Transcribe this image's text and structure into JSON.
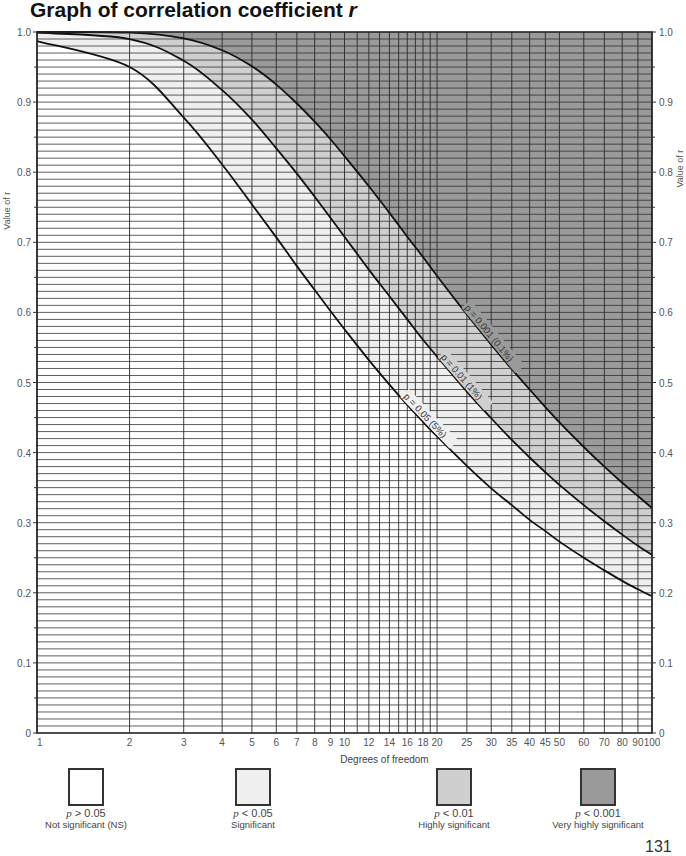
{
  "title": "Graph of correlation coefficient",
  "title_symbol": "r",
  "page_number": "131",
  "chart_data": {
    "type": "line",
    "title": "Graph of correlation coefficient r",
    "xlabel": "Degrees of freedom",
    "ylabel": "Value of r",
    "xscale": "log",
    "xlim": [
      1,
      100
    ],
    "ylim": [
      0,
      1.0
    ],
    "grid": true,
    "x_ticks": [
      1,
      2,
      3,
      4,
      5,
      6,
      7,
      8,
      9,
      10,
      12,
      14,
      16,
      18,
      20,
      25,
      30,
      35,
      40,
      45,
      50,
      60,
      70,
      80,
      90,
      100
    ],
    "x_gridlines": [
      1,
      2,
      3,
      4,
      5,
      6,
      7,
      8,
      9,
      10,
      11,
      12,
      13,
      14,
      15,
      16,
      17,
      18,
      19,
      20,
      25,
      30,
      35,
      40,
      45,
      50,
      60,
      70,
      80,
      90,
      100
    ],
    "y_ticks": [
      0,
      0.1,
      0.2,
      0.3,
      0.4,
      0.5,
      0.6,
      0.7,
      0.8,
      0.9,
      1.0
    ],
    "y_tick_labels": [
      "0",
      "0.1",
      "0.2",
      "0.3",
      "0.4",
      "0.5",
      "0.6",
      "0.7",
      "0.8",
      "0.9",
      "1.0"
    ],
    "y_grid_step": 0.01,
    "x": [
      1,
      2,
      3,
      4,
      5,
      6,
      7,
      8,
      9,
      10,
      12,
      14,
      16,
      18,
      20,
      25,
      30,
      35,
      40,
      45,
      50,
      60,
      70,
      80,
      90,
      100
    ],
    "series": [
      {
        "name": "p = 0.05 (5%)",
        "label": "p = 0.05 (5%)",
        "values": [
          0.987,
          0.95,
          0.878,
          0.811,
          0.754,
          0.707,
          0.666,
          0.632,
          0.602,
          0.576,
          0.532,
          0.497,
          0.468,
          0.444,
          0.423,
          0.381,
          0.349,
          0.325,
          0.304,
          0.288,
          0.273,
          0.25,
          0.232,
          0.217,
          0.205,
          0.195
        ]
      },
      {
        "name": "p = 0.01 (1%)",
        "label": "p = 0.01 (1%)",
        "values": [
          0.999,
          0.99,
          0.959,
          0.917,
          0.875,
          0.834,
          0.798,
          0.765,
          0.735,
          0.708,
          0.661,
          0.623,
          0.59,
          0.561,
          0.537,
          0.487,
          0.449,
          0.418,
          0.393,
          0.372,
          0.354,
          0.325,
          0.302,
          0.283,
          0.267,
          0.254
        ]
      },
      {
        "name": "p = 0.001 (0.1%)",
        "label": "p = 0.001 (0.1%)",
        "values": [
          1.0,
          0.999,
          0.991,
          0.974,
          0.951,
          0.925,
          0.898,
          0.872,
          0.847,
          0.823,
          0.78,
          0.742,
          0.708,
          0.679,
          0.652,
          0.597,
          0.554,
          0.519,
          0.49,
          0.465,
          0.443,
          0.408,
          0.38,
          0.357,
          0.338,
          0.321
        ]
      }
    ],
    "regions": [
      {
        "label": "Not significant (NS)",
        "condition": "p > 0.05",
        "color": "#ffffff"
      },
      {
        "label": "Significant",
        "condition": "p < 0.05",
        "color": "#efefef"
      },
      {
        "label": "Highly significant",
        "condition": "p < 0.01",
        "color": "#cfcfcf"
      },
      {
        "label": "Very highly significant",
        "condition": "p < 0.001",
        "color": "#9a9a9a"
      }
    ],
    "legend_position": "bottom"
  },
  "legend": [
    {
      "p_sym": "p",
      "p_rest": " > 0.05",
      "label": "Not significant (NS)",
      "color": "#ffffff"
    },
    {
      "p_sym": "p",
      "p_rest": " < 0.05",
      "label": "Significant",
      "color": "#efefef"
    },
    {
      "p_sym": "p",
      "p_rest": " < 0.01",
      "label": "Highly significant",
      "color": "#cfcfcf"
    },
    {
      "p_sym": "p",
      "p_rest": " < 0.001",
      "label": "Very highly significant",
      "color": "#9a9a9a"
    }
  ]
}
